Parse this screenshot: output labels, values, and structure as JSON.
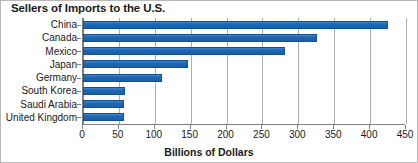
{
  "chart_data": {
    "type": "bar",
    "orientation": "horizontal",
    "title": "Sellers of Imports to the U.S.",
    "xlabel": "Billions of Dollars",
    "ylabel": "",
    "categories": [
      "China",
      "Canada",
      "Mexico",
      "Japan",
      "Germany",
      "South Korea",
      "Saudi Arabia",
      "United Kingdom"
    ],
    "values": [
      425,
      326,
      281,
      146,
      110,
      58,
      57,
      57
    ],
    "xlim": [
      0,
      450
    ],
    "xticks": [
      0,
      50,
      100,
      150,
      200,
      250,
      300,
      350,
      400,
      450
    ],
    "xtick_labels": [
      "0",
      "50",
      "100",
      "150",
      "200",
      "250",
      "300",
      "350",
      "400",
      "450"
    ],
    "grid": "vertical",
    "legend": "none",
    "series": [
      {
        "name": "Imports",
        "color": "#1f68b5",
        "values": [
          425,
          326,
          281,
          146,
          110,
          58,
          57,
          57
        ]
      }
    ]
  },
  "colors": {
    "bar": "#1f68b5",
    "bar_edge": "#15528f",
    "grid": "#b0b0b0",
    "axis": "#808080",
    "text": "#1a1a1a",
    "background": "#ffffff",
    "border": "#b9b9b9"
  }
}
